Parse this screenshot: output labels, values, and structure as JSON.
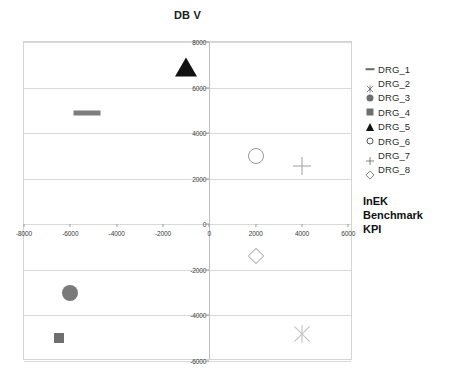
{
  "chart_data": {
    "type": "scatter",
    "title": "DB V",
    "xlabel": "InEK Benchmark KPI",
    "ylabel": "",
    "xlim": [
      -8000,
      6200
    ],
    "ylim": [
      -6000,
      8000
    ],
    "xticks": [
      -8000,
      -6000,
      -4000,
      -2000,
      0,
      2000,
      4000,
      6000
    ],
    "xtick_labels": [
      "-8000",
      "-6000",
      "-4000",
      "-2000",
      "0",
      "2000",
      "4000",
      "6000"
    ],
    "yticks": [
      -6000,
      -4000,
      -2000,
      0,
      2000,
      4000,
      6000,
      8000
    ],
    "ytick_labels": [
      "-6000",
      "-4000",
      "-2000",
      "0",
      "2000",
      "4000",
      "6000",
      "8000"
    ],
    "grid": "horizontal",
    "legend_position": "right",
    "series": [
      {
        "name": "DRG_1",
        "marker": "dash",
        "color": "#7d7d7d",
        "x": [
          -5300
        ],
        "y": [
          4900
        ]
      },
      {
        "name": "DRG_2",
        "marker": "x-cross",
        "color": "#c2c2c2",
        "x": [
          4000
        ],
        "y": [
          -4800
        ]
      },
      {
        "name": "DRG_3",
        "marker": "circle-filled",
        "color": "#7a7a7a",
        "x": [
          -6000
        ],
        "y": [
          -3000
        ]
      },
      {
        "name": "DRG_4",
        "marker": "square-filled",
        "color": "#6f6f6f",
        "x": [
          -6500
        ],
        "y": [
          -5000
        ]
      },
      {
        "name": "DRG_5",
        "marker": "triangle-filled",
        "color": "#111111",
        "x": [
          -1000
        ],
        "y": [
          6900
        ]
      },
      {
        "name": "DRG_6",
        "marker": "circle-open",
        "color": "#989898",
        "x": [
          2000
        ],
        "y": [
          3000
        ]
      },
      {
        "name": "DRG_7",
        "marker": "plus",
        "color": "#adadad",
        "x": [
          4000
        ],
        "y": [
          2550
        ]
      },
      {
        "name": "DRG_8",
        "marker": "diamond-open",
        "color": "#b0b0b0",
        "x": [
          2000
        ],
        "y": [
          -1400
        ]
      }
    ]
  },
  "title": {
    "text": "DB V"
  },
  "legend": {
    "items": [
      {
        "label": "DRG_1"
      },
      {
        "label": "DRG_2"
      },
      {
        "label": "DRG_3"
      },
      {
        "label": "DRG_4"
      },
      {
        "label": "DRG_5"
      },
      {
        "label": "DRG_6"
      },
      {
        "label": "DRG_7"
      },
      {
        "label": "DRG_8"
      }
    ]
  },
  "axis_caption": {
    "line1": "InEK",
    "line2": "Benchmark",
    "line3": "KPI"
  }
}
